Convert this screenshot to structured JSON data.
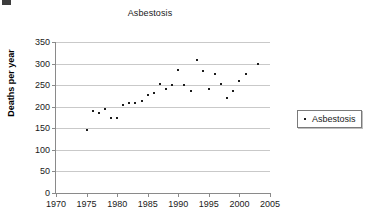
{
  "chart_data": {
    "type": "scatter",
    "title": "Asbestosis",
    "xlabel": "",
    "ylabel": "Deaths per year",
    "xlim": [
      1970,
      2005
    ],
    "ylim": [
      0,
      350
    ],
    "xticks": [
      1970,
      1975,
      1980,
      1985,
      1990,
      1995,
      2000,
      2005
    ],
    "yticks": [
      0,
      50,
      100,
      150,
      200,
      250,
      300,
      350
    ],
    "grid": true,
    "legend_position": "right",
    "marker_color": "#1c1c1c",
    "series": [
      {
        "name": "Asbestosis",
        "x": [
          1975,
          1976,
          1977,
          1978,
          1979,
          1980,
          1981,
          1982,
          1983,
          1984,
          1985,
          1986,
          1987,
          1988,
          1989,
          1990,
          1991,
          1992,
          1993,
          1994,
          1995,
          1996,
          1997,
          1998,
          1999,
          2000,
          2001,
          2003
        ],
        "values": [
          147,
          191,
          186,
          194,
          175,
          175,
          203,
          208,
          208,
          214,
          226,
          231,
          252,
          240,
          251,
          284,
          250,
          237,
          308,
          282,
          241,
          275,
          253,
          220,
          237,
          259,
          276,
          299
        ]
      }
    ]
  },
  "legend": {
    "entries": [
      {
        "label": "Asbestosis",
        "marker": "dot-marker"
      }
    ]
  }
}
